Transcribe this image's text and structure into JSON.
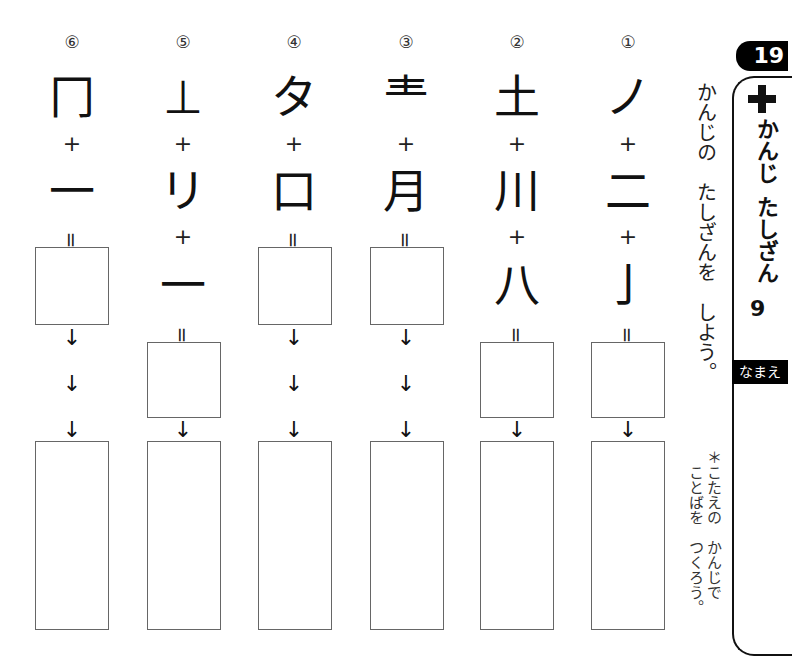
{
  "header": {
    "lesson_number": "19",
    "plus_icon": "plus-icon",
    "title_part1": "かんじ",
    "title_part2": "たしざん",
    "title_number": "9",
    "name_label": "なまえ"
  },
  "instruction": "かんじの　たしざんを　しよう。",
  "note_line1": "＊こたえの　かんじで",
  "note_line2": "ことばを　つくろう。",
  "symbols": {
    "plus": "+",
    "equals": "=",
    "arrow": "↓"
  },
  "problems": [
    {
      "number": "⑥",
      "parts": [
        "冂",
        "一"
      ]
    },
    {
      "number": "⑤",
      "parts": [
        "⊥",
        "リ",
        "一"
      ]
    },
    {
      "number": "④",
      "parts": [
        "タ",
        "口"
      ]
    },
    {
      "number": "③",
      "parts": [
        "龶",
        "月"
      ]
    },
    {
      "number": "②",
      "parts": [
        "土",
        "川",
        "八"
      ]
    },
    {
      "number": "①",
      "parts": [
        "ノ",
        "二",
        "亅"
      ]
    }
  ]
}
